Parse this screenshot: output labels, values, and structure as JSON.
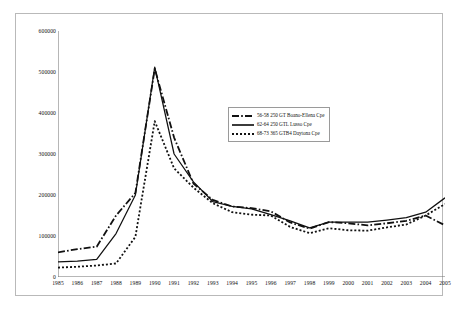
{
  "chart_data": {
    "type": "line",
    "title": "",
    "subtitle": "",
    "xlabel": "",
    "ylabel": "",
    "x": [
      1985,
      1986,
      1987,
      1988,
      1989,
      1990,
      1991,
      1992,
      1993,
      1994,
      1995,
      1996,
      1997,
      1998,
      1999,
      2000,
      2001,
      2002,
      2003,
      2004,
      2005
    ],
    "categories": [
      "1985",
      "1986",
      "1987",
      "1988",
      "1989",
      "1990",
      "1991",
      "1992",
      "1993",
      "1994",
      "1995",
      "1996",
      "1997",
      "1998",
      "1999",
      "2000",
      "2001",
      "2002",
      "2003",
      "2004",
      "2005"
    ],
    "xlim": [
      1985,
      2005
    ],
    "ylim": [
      0,
      600000
    ],
    "yticks": [
      0,
      100000,
      200000,
      300000,
      400000,
      500000,
      600000
    ],
    "ytick_labels": [
      "0",
      "100000",
      "200000",
      "300000",
      "400000",
      "500000",
      "600000"
    ],
    "grid": false,
    "legend_position": "center-right",
    "series": [
      {
        "name": "56-58 250 GT Boano-Ellena Cpe",
        "style": "dash-dot",
        "color": "#111111",
        "values": [
          60000,
          68000,
          74000,
          150000,
          205000,
          508000,
          340000,
          228000,
          188000,
          172000,
          168000,
          160000,
          133000,
          118000,
          134000,
          131000,
          126000,
          131000,
          137000,
          150000,
          126000
        ]
      },
      {
        "name": "62-64 250 GTL Lusso Cpe",
        "style": "solid",
        "color": "#111111",
        "values": [
          37000,
          39000,
          43000,
          106000,
          200000,
          512000,
          300000,
          232000,
          184000,
          172000,
          166000,
          152000,
          137000,
          120000,
          134000,
          134000,
          134000,
          139000,
          145000,
          158000,
          193000
        ]
      },
      {
        "name": "68-73 365 GTB4 Daytona Cpe",
        "style": "dotted",
        "color": "#111111",
        "values": [
          23000,
          25000,
          28000,
          33000,
          98000,
          380000,
          265000,
          218000,
          180000,
          158000,
          152000,
          150000,
          122000,
          107000,
          119000,
          114000,
          113000,
          121000,
          128000,
          150000,
          178000
        ]
      }
    ]
  },
  "legend": {
    "items": [
      {
        "label": "56-58 250 GT Boano-Ellena Cpe",
        "style": "dash-dot"
      },
      {
        "label": "62-64 250 GTL Lusso Cpe",
        "style": "solid"
      },
      {
        "label": "68-73 365 GTB4 Daytona Cpe",
        "style": "dotted"
      }
    ]
  }
}
